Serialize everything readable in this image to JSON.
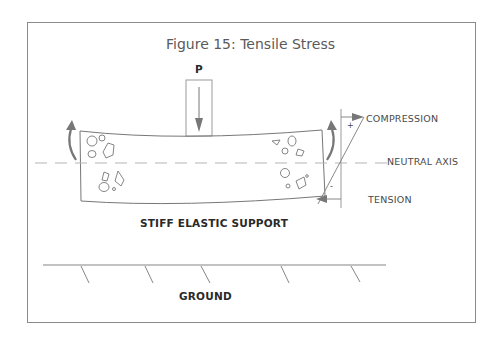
{
  "figure": {
    "title": "Figure 15: Tensile Stress",
    "load_label": "P",
    "labels": {
      "compression": "COMPRESSION",
      "neutral_axis": "NEUTRAL AXIS",
      "tension": "TENSION",
      "support": "STIFF ELASTIC SUPPORT",
      "ground": "GROUND",
      "plus": "+",
      "minus": "-"
    },
    "colors": {
      "line": "#7a7a7a",
      "arrow": "#6e6e6e",
      "dash": "#b5b5b5",
      "text": "#4a4a4a"
    }
  }
}
